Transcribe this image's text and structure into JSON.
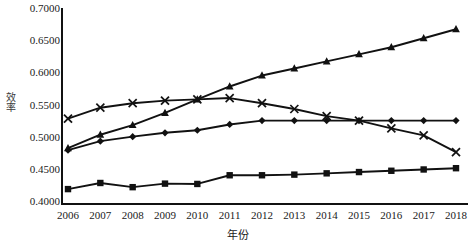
{
  "chart_data": {
    "type": "line",
    "title": "",
    "xlabel": "年份",
    "ylabel": "效率",
    "categories": [
      "2006",
      "2007",
      "2008",
      "2009",
      "2010",
      "2011",
      "2012",
      "2013",
      "2014",
      "2015",
      "2016",
      "2017",
      "2018"
    ],
    "x": [
      2006,
      2007,
      2008,
      2009,
      2010,
      2011,
      2012,
      2013,
      2014,
      2015,
      2016,
      2017,
      2018
    ],
    "ylim": [
      0.4,
      0.7
    ],
    "ytick_labels": [
      "0.4000",
      "0.4500",
      "0.5000",
      "0.5500",
      "0.6000",
      "0.6500",
      "0.7000"
    ],
    "ytick_values": [
      0.4,
      0.45,
      0.5,
      0.55,
      0.6,
      0.65,
      0.7
    ],
    "grid": false,
    "legend": "none",
    "series": [
      {
        "name": "diamond-series",
        "marker": "diamond",
        "color": "#111111",
        "values": [
          0.479,
          0.493,
          0.5,
          0.506,
          0.51,
          0.519,
          0.525,
          0.525,
          0.525,
          0.525,
          0.525,
          0.525,
          0.525
        ]
      },
      {
        "name": "square-series",
        "marker": "square",
        "color": "#111111",
        "values": [
          0.4185,
          0.428,
          0.4215,
          0.427,
          0.4265,
          0.44,
          0.44,
          0.441,
          0.443,
          0.445,
          0.447,
          0.449,
          0.451
        ]
      },
      {
        "name": "triangle-series",
        "marker": "triangle",
        "color": "#111111",
        "values": [
          0.482,
          0.503,
          0.518,
          0.537,
          0.558,
          0.578,
          0.595,
          0.606,
          0.617,
          0.628,
          0.639,
          0.653,
          0.667
        ]
      },
      {
        "name": "cross-series",
        "marker": "cross",
        "color": "#111111",
        "values": [
          0.528,
          0.545,
          0.552,
          0.556,
          0.558,
          0.56,
          0.552,
          0.543,
          0.532,
          0.525,
          0.513,
          0.502,
          0.476
        ]
      }
    ]
  }
}
